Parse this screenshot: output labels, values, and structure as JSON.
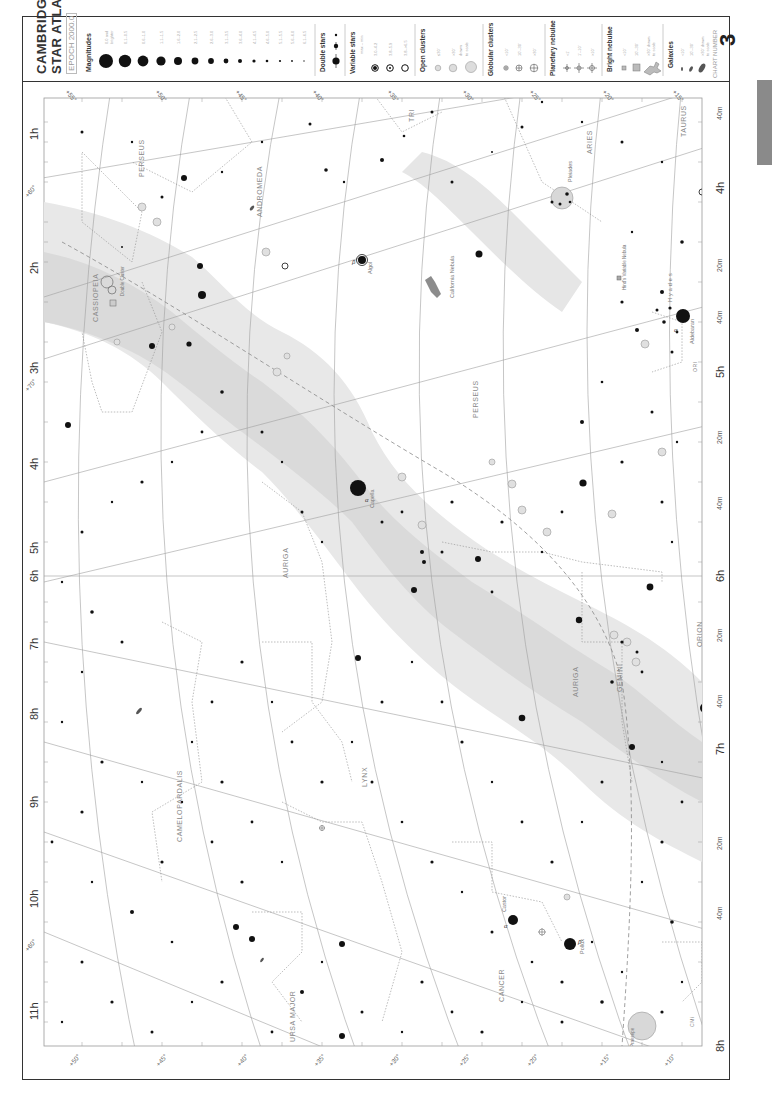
{
  "atlas": {
    "title_line1": "CAMBRIDGE",
    "title_line2": "STAR ATLAS",
    "epoch": "EPOCH 2000.0",
    "chart_number_label": "CHART NUMBER",
    "chart_number": "3"
  },
  "legend": {
    "magnitudes": {
      "title": "Magnitudes",
      "entries": [
        "0.0 and brighter",
        "0.1–0.5",
        "0.6–1.0",
        "1.1–1.5",
        "1.6–2.0",
        "2.1–2.5",
        "2.6–3.0",
        "3.1–3.5",
        "3.6–4.0",
        "4.1–4.5",
        "4.6–5.0",
        "5.1–5.5",
        "5.6–6.0",
        "6.1–6.5"
      ]
    },
    "double_stars": {
      "title": "Double stars"
    },
    "variable_stars": {
      "title": "Variable stars",
      "subtitle": "max – min",
      "entries": [
        "3.0–4.2",
        "3.8–5.9",
        "3.8–>6.5"
      ]
    },
    "open_clusters": {
      "title": "Open clusters",
      "entries": [
        "≤30'",
        ">30'",
        "drawn to scale"
      ]
    },
    "globular_clusters": {
      "title": "Globular clusters",
      "entries": [
        "<10'",
        "10'–30'",
        ">30'"
      ]
    },
    "planetary_nebulae": {
      "title": "Planetary nebulae",
      "entries": [
        "<1'",
        "1'–10'",
        ">10'"
      ]
    },
    "bright_nebulae": {
      "title": "Bright nebulae",
      "entries": [
        "<10'",
        "10'–30'",
        "> 30' drawn to scale"
      ]
    },
    "galaxies": {
      "title": "Galaxies",
      "entries": [
        "<10'",
        "10'–30'",
        "> 30' drawn to scale"
      ]
    }
  },
  "axes": {
    "ra_labels": [
      "1h",
      "2h",
      "3h",
      "4h",
      "5h",
      "6h",
      "7h",
      "8h",
      "9h",
      "10h",
      "11h"
    ],
    "ra_minute_labels": [
      "20m",
      "40m"
    ],
    "dec_top": [
      "+55°",
      "+50°",
      "+45°",
      "+40°",
      "+35°",
      "+30°",
      "+25°",
      "+20°",
      "+15°"
    ],
    "dec_bottom": [
      "+50°",
      "+45°",
      "+40°",
      "+35°",
      "+30°",
      "+25°",
      "+20°",
      "+15°",
      "+10°"
    ],
    "dec_left": [
      "+60°",
      "+70°",
      "+60°"
    ],
    "right_ra_labels": [
      "4h",
      "5h",
      "6h",
      "7h",
      "8h"
    ],
    "dec_right": [
      "+10°"
    ]
  },
  "constellations": [
    "CASSIOPEIA",
    "PERSEUS",
    "ANDROMEDA",
    "TRI",
    "ARIES",
    "TAURUS",
    "AURIGA",
    "CAMELOPARDALIS",
    "GEMINI",
    "ORION",
    "LYNX",
    "CANCER",
    "URSA MAJOR",
    "LMi",
    "CMi",
    "ORI"
  ],
  "named_objects": [
    {
      "name": "Capella",
      "designation": "α"
    },
    {
      "name": "Aldebaran",
      "designation": "α"
    },
    {
      "name": "Algol",
      "designation": "β"
    },
    {
      "name": "Castor",
      "designation": "α"
    },
    {
      "name": "Pollux",
      "designation": "β"
    },
    {
      "name": "Pleiades",
      "designation": "M45"
    },
    {
      "name": "Hyades"
    },
    {
      "name": "California Nebula",
      "designation": "1499"
    },
    {
      "name": "Double Cluster",
      "designation": "869 (h) / 884 (χ)"
    },
    {
      "name": "Hind's Variable Nebula",
      "designation": "1554-55"
    },
    {
      "name": "Praesepe",
      "designation": "M44"
    }
  ],
  "deep_sky_labels": [
    "M34",
    "M103",
    "M76",
    "M36",
    "M37",
    "M38",
    "M35",
    "M1",
    "1502",
    "1342",
    "1245",
    "1528",
    "1664",
    "1857",
    "1907",
    "1912",
    "1960",
    "2099",
    "2281",
    "2331",
    "2392",
    "2403",
    "2419",
    "2683",
    "2841",
    "2976",
    "3077",
    "3184",
    "3198",
    "1664",
    "IC 1805",
    "IC 1848",
    "752",
    "891",
    "1023",
    "404",
    "1647",
    "1817",
    "1807",
    "2174",
    "2175",
    "2158",
    "1973",
    "7789",
    "654",
    "663",
    "1027",
    "457",
    "581"
  ],
  "colors": {
    "milky_way": "#e6e6e6",
    "milky_way_dark": "#d6d6d6",
    "grid": "#9a9a9a",
    "boundary": "#8c8c8c",
    "ecliptic": "#9a9a9a",
    "star": "#111111",
    "label": "#888888",
    "frame": "#333333",
    "tab": "#8a8a8a"
  }
}
